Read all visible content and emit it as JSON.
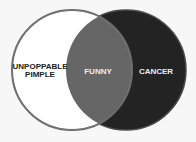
{
  "diagram": {
    "type": "venn",
    "sets": [
      {
        "label_line1": "UNPOPPABLE",
        "label_line2": "PIMPLE",
        "fill": "#ffffff",
        "stroke": "#6e6e6e"
      },
      {
        "label": "CANCER",
        "fill": "#232323",
        "stroke": "#4a4a4a"
      }
    ],
    "intersection": {
      "label": "FUNNY",
      "fill": "#666666"
    },
    "colors": {
      "background": "#f7f7f7",
      "text_light": "#eeeeee",
      "text_dark": "#222222"
    }
  }
}
